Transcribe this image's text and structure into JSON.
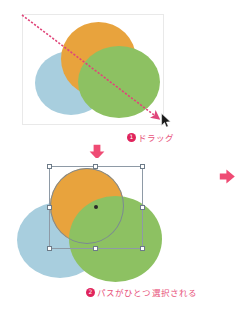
{
  "document": {
    "title": "パス選択操作の図解",
    "background_color": "#ffffff"
  },
  "palette": {
    "orange": "#e8a33d",
    "green": "#8dc162",
    "blue": "#a8cede",
    "pink_accent": "#e8547c",
    "badge_fill": "#e0245c",
    "selection_stroke": "#8e9aa6",
    "handle_fill": "#ffffff",
    "panel_border": "#e9e9e9",
    "cursor_fill": "#1a1a1a",
    "drag_line": "#e0457a"
  },
  "steps": [
    {
      "id": "step-1",
      "number": "❶",
      "number_plain": "1",
      "caption": "ドラッグ",
      "panel": {
        "name": "panel-before-selection",
        "shapes": [
          {
            "name": "ellipse-blue",
            "color": "#a8cede",
            "z": 1
          },
          {
            "name": "ellipse-orange",
            "color": "#e8a33d",
            "z": 2
          },
          {
            "name": "ellipse-green",
            "color": "#8dc162",
            "z": 3
          }
        ],
        "drag_line": {
          "name": "drag-marquee-line",
          "from": [
            22,
            15
          ],
          "to": [
            163,
            122
          ],
          "style": "dashed-arrow",
          "color": "#e0457a"
        },
        "cursor": {
          "name": "mouse-pointer",
          "x": 161,
          "y": 113
        }
      }
    },
    {
      "id": "step-2",
      "number": "❷",
      "number_plain": "2",
      "caption": "パスがひとつ選択される",
      "panel": {
        "name": "panel-after-selection",
        "shapes": [
          {
            "name": "ellipse-blue",
            "color": "#a8cede",
            "z": 1
          },
          {
            "name": "ellipse-orange",
            "color": "#e8a33d",
            "z": 2,
            "selected": true
          },
          {
            "name": "ellipse-green",
            "color": "#8dc162",
            "z": 3
          }
        ],
        "selection": {
          "name": "bounding-box",
          "handles": 8,
          "center_point": true,
          "stroke": "#8e9aa6"
        }
      }
    }
  ],
  "flow_arrows": [
    {
      "name": "arrow-down",
      "direction": "down",
      "color": "#e8547c"
    },
    {
      "name": "arrow-right",
      "direction": "right",
      "color": "#e8547c"
    }
  ]
}
